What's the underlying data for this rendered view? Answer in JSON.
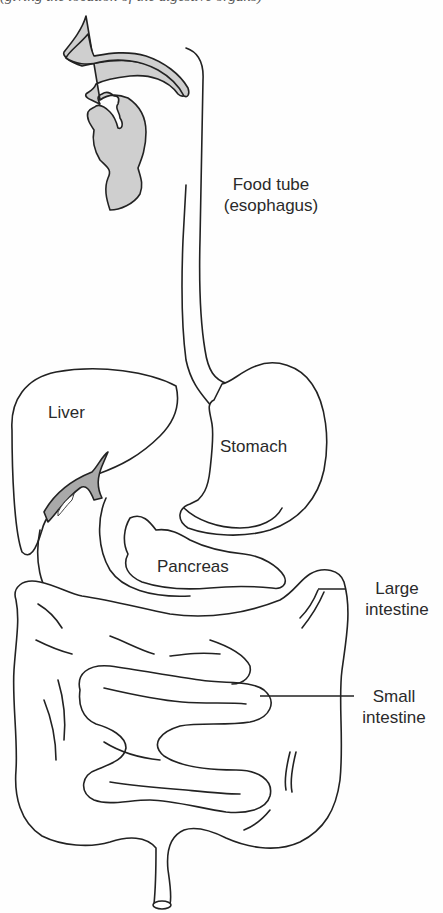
{
  "figure": {
    "type": "anatomical-diagram",
    "colors": {
      "line": "#222222",
      "shade_head": "#cfcfcf",
      "shade_gallbladder": "#a9a9a9",
      "background": "#fefefe"
    }
  },
  "cropped_header_text": "(giving the location of the digestive organs)",
  "labels": {
    "esophagus_line1": "Food tube",
    "esophagus_line2": "(esophagus)",
    "liver": "Liver",
    "stomach": "Stomach",
    "pancreas": "Pancreas",
    "large_intestine_line1": "Large",
    "large_intestine_line2": "intestine",
    "small_intestine_line1": "Small",
    "small_intestine_line2": "intestine"
  }
}
